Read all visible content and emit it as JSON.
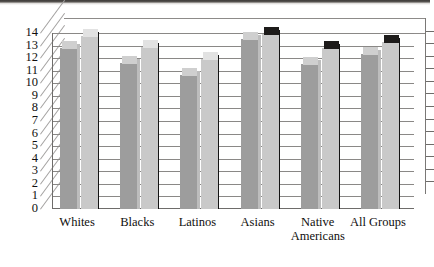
{
  "chart_data": {
    "type": "bar",
    "title": "",
    "subtitle": "",
    "xlabel": "",
    "ylabel": "",
    "ylim": [
      0,
      14
    ],
    "ytick_labels": [
      "0",
      "1",
      "2",
      "3",
      "4",
      "5",
      "6",
      "7",
      "8",
      "9",
      "10",
      "11",
      "12",
      "13",
      "14"
    ],
    "grid": true,
    "legend": "none",
    "style": "3d-grouped-bars-grayscale",
    "categories": [
      "Whites",
      "Blacks",
      "Latinos",
      "Asians",
      "Native Americans",
      "All Groups"
    ],
    "category_lines": [
      [
        "Whites"
      ],
      [
        "Blacks"
      ],
      [
        "Latinos"
      ],
      [
        "Asians"
      ],
      [
        "Native",
        "Americans"
      ],
      [
        "All Groups"
      ]
    ],
    "series": [
      {
        "name": "Series 1",
        "color": "#9d9d9d",
        "values": [
          12.8,
          11.6,
          10.7,
          13.5,
          11.5,
          12.3
        ]
      },
      {
        "name": "Series 2",
        "color": "#c9c9c9",
        "values": [
          13.8,
          12.9,
          11.9,
          13.9,
          12.8,
          13.3
        ]
      }
    ]
  },
  "axis": {
    "right_axis_ticks": 13,
    "top_page_rule": true
  }
}
